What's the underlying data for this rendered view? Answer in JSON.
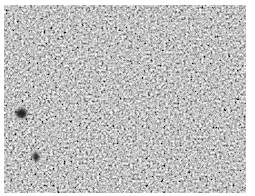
{
  "image": {
    "description": "Grayscale granular micrograph texture",
    "palette": {
      "background": "#ffffff",
      "mid_gray": "#9a9a9a",
      "dark_feature": "#222222",
      "light_grain": "#f0f0f0"
    },
    "texture_region": {
      "x": 4,
      "y": 5,
      "width": 242,
      "height": 188
    },
    "dark_features": [
      {
        "x": 20,
        "y": 113,
        "r": 5
      },
      {
        "x": 35,
        "y": 155,
        "r": 3
      }
    ]
  }
}
